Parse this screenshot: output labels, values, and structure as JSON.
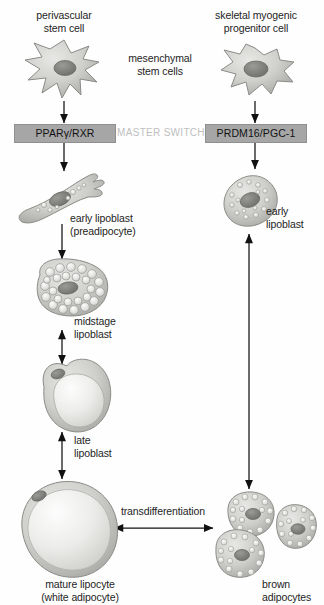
{
  "figure": {
    "background_color": "#fefefe",
    "text_color": "#1d1d1d",
    "switch_box_color": "#a6a6a6",
    "master_switch_color": "#c0c0c0"
  },
  "labels": {
    "perivascular_stem_cell": "perivascular\nstem cell",
    "skeletal_myogenic_progenitor_cell": "skeletal myogenic\nprogenitor cell",
    "mesenchymal_stem_cells": "mesenchymal\nstem cells",
    "master_switch": "MASTER SWITCH",
    "ppar_rxr": "PPARγ/RXR",
    "prdm16_pgc1": "PRDM16/PGC-1",
    "early_lipoblast_preadipocyte": "early lipoblast\n(preadipocyte)",
    "early_lipoblast_right": "early\nlipoblast",
    "midstage_lipoblast": "midstage\nlipoblast",
    "late_lipoblast": "late\nlipoblast",
    "mature_lipocyte": "mature lipocyte\n(white adipocyte)",
    "brown_adipocytes": "brown\nadipocytes",
    "transdifferentiation": "transdifferentiation"
  },
  "cells": [
    {
      "name": "perivascular-stem-cell",
      "type": "stellate",
      "cx": 64,
      "cy": 74
    },
    {
      "name": "skeletal-myogenic-progenitor-cell",
      "type": "spiky-oval",
      "cx": 255,
      "cy": 74
    },
    {
      "name": "early-lipoblast-preadipocyte",
      "type": "spindle",
      "cx": 62,
      "cy": 200
    },
    {
      "name": "early-lipoblast-brown",
      "type": "multilocular-oval",
      "cx": 248,
      "cy": 200
    },
    {
      "name": "midstage-lipoblast",
      "type": "polygonal-vacuolated",
      "cx": 72,
      "cy": 288
    },
    {
      "name": "late-lipoblast",
      "type": "unilocular-large-droplet",
      "cx": 76,
      "cy": 392
    },
    {
      "name": "mature-lipocyte-white-adipocyte",
      "type": "unilocular-round",
      "cx": 70,
      "cy": 530
    },
    {
      "name": "brown-adipocytes",
      "type": "multilocular-cluster",
      "cx": 258,
      "cy": 542
    }
  ],
  "arrows": [
    {
      "name": "arrow-perivascular-to-switch",
      "direction": "down",
      "x": 64,
      "y1": 104,
      "y2": 124
    },
    {
      "name": "arrow-switch-to-early-lipoblast",
      "direction": "down",
      "x": 64,
      "y1": 142,
      "y2": 172
    },
    {
      "name": "arrow-skeletal-to-switch",
      "direction": "down",
      "x": 255,
      "y1": 104,
      "y2": 124
    },
    {
      "name": "arrow-switch-to-early-lipoblast-right",
      "direction": "down",
      "x": 255,
      "y1": 142,
      "y2": 170
    },
    {
      "name": "arrow-early-to-midstage",
      "direction": "down",
      "x": 62,
      "y1": 222,
      "y2": 258
    },
    {
      "name": "arrow-midstage-to-late",
      "direction": "both",
      "x": 62,
      "y1": 328,
      "y2": 364
    },
    {
      "name": "arrow-late-to-mature",
      "direction": "both",
      "x": 62,
      "y1": 430,
      "y2": 478
    },
    {
      "name": "arrow-brown-vertical",
      "direction": "both",
      "x": 249,
      "y1": 232,
      "y2": 488
    },
    {
      "name": "arrow-transdifferentiation",
      "direction": "both",
      "x1": 112,
      "x2": 214,
      "y": 528
    }
  ]
}
